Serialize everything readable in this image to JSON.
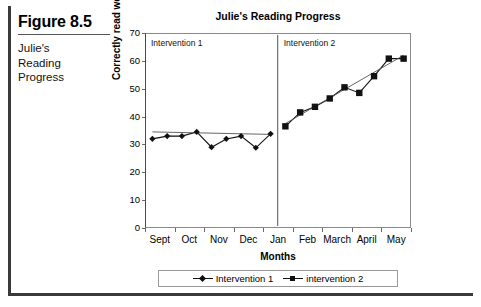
{
  "caption": {
    "figure_number": "Figure 8.5",
    "description": "Julie's\nReading\nProgress",
    "line1": "Julie's",
    "line2": "Reading",
    "line3": "Progress"
  },
  "legend": {
    "series1_label": "Intervention 1",
    "series2_label": "intervention 2"
  },
  "phases": {
    "phase1_label": "Intervention 1",
    "phase2_label": "Intervention 2"
  },
  "chart_data": {
    "type": "line",
    "title": "Julie's Reading Progress",
    "xlabel": "Months",
    "ylabel": "Correctly read words",
    "ylim": [
      0,
      70
    ],
    "yticks": [
      0,
      10,
      20,
      30,
      40,
      50,
      60,
      70
    ],
    "grid": false,
    "legend_position": "bottom",
    "xtick_labels": [
      "Sept",
      "Oct",
      "Nov",
      "Dec",
      "Jan",
      "Feb",
      "March",
      "April",
      "May"
    ],
    "phase_change_after_index": 8,
    "series": [
      {
        "name": "Intervention 1",
        "marker": "diamond",
        "x": [
          0,
          1,
          2,
          3,
          4,
          5,
          6,
          7,
          8
        ],
        "values": [
          32,
          33,
          33,
          34.5,
          29,
          32,
          33,
          28.8,
          33.8
        ],
        "trend_start": 34.5,
        "trend_end": 33.6
      },
      {
        "name": "intervention 2",
        "marker": "square",
        "x": [
          9,
          10,
          11,
          12,
          13,
          14,
          15,
          16,
          17
        ],
        "values": [
          36.5,
          41.5,
          43.5,
          46.5,
          50.5,
          48.5,
          54.5,
          60.8,
          60.8
        ],
        "trend_start": 37.5,
        "trend_end": 62
      }
    ]
  }
}
